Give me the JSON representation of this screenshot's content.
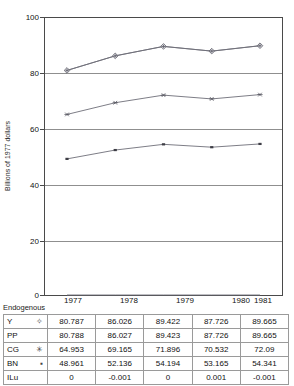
{
  "chart_data": {
    "type": "line",
    "title": "",
    "xlabel": "",
    "ylabel": "Billions of 1977 dollars",
    "x": [
      "1977",
      "1978",
      "1979",
      "1980",
      "1981"
    ],
    "categories": [
      "1977",
      "1978",
      "1979",
      "1980",
      "1981"
    ],
    "ylim": [
      0,
      100
    ],
    "yticks": [
      "0",
      "20",
      "40",
      "60",
      "80",
      "100"
    ],
    "grid": true,
    "legend": "none",
    "series": [
      {
        "name": "Y",
        "marker": "diamond-plus",
        "values": [
          80.787,
          86.026,
          89.422,
          87.726,
          89.665
        ]
      },
      {
        "name": "PP",
        "marker": "none",
        "values": [
          80.788,
          86.027,
          89.423,
          87.726,
          89.665
        ]
      },
      {
        "name": "CG",
        "marker": "asterisk",
        "values": [
          64.953,
          69.165,
          71.896,
          70.532,
          72.09
        ]
      },
      {
        "name": "BN",
        "marker": "dash-square",
        "values": [
          48.961,
          52.136,
          54.194,
          53.165,
          54.341
        ]
      },
      {
        "name": "ILu",
        "marker": "none",
        "values": [
          0,
          -0.001,
          0,
          0.001,
          -0.001
        ]
      }
    ]
  },
  "axis": {
    "y_title": "Billions of 1977 dollars",
    "y_ticks": [
      "100",
      "80",
      "60",
      "40",
      "20",
      "0"
    ],
    "x_ticks": [
      "1977",
      "1978",
      "1979",
      "1980",
      "1981"
    ]
  },
  "table": {
    "corner_label": "Endogenous",
    "columns": [
      "1977",
      "1978",
      "1979",
      "1980",
      "1981"
    ],
    "rows": [
      {
        "label": "Y",
        "symbol": "✧",
        "values": [
          "80.787",
          "86.026",
          "89.422",
          "87.726",
          "89.665"
        ]
      },
      {
        "label": "PP",
        "symbol": "",
        "values": [
          "80.788",
          "86.027",
          "89.423",
          "87.726",
          "89.665"
        ]
      },
      {
        "label": "CG",
        "symbol": "✳",
        "values": [
          "64.953",
          "69.165",
          "71.896",
          "70.532",
          "72.09"
        ]
      },
      {
        "label": "BN",
        "symbol": "▪",
        "values": [
          "48.961",
          "52.136",
          "54.194",
          "53.165",
          "54.341"
        ]
      },
      {
        "label": "ILu",
        "symbol": "",
        "values": [
          "0",
          "-0.001",
          "0",
          "0.001",
          "-0.001"
        ]
      }
    ]
  },
  "colors": {
    "line": "#6e6e78",
    "grid": "#8f8f8f",
    "border": "#4a4a4a",
    "text": "#111111"
  }
}
